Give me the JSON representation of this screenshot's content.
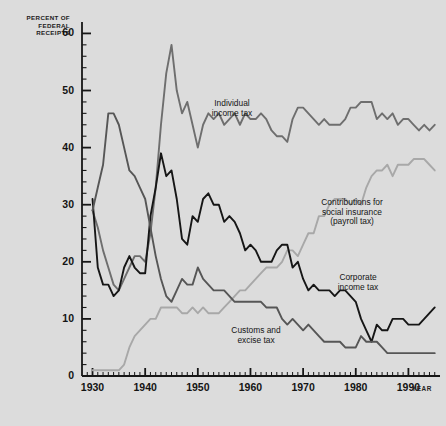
{
  "chart_data": {
    "type": "line",
    "title": "",
    "xlabel": "YEAR",
    "ylabel": "PERCENT OF FEDERAL RECEIPTS",
    "ylabel_lines": [
      "PERCENT OF",
      "FEDERAL",
      "RECEIPTS"
    ],
    "xlim": [
      1928,
      1996
    ],
    "ylim": [
      0,
      62
    ],
    "y_ticks": [
      0,
      10,
      20,
      30,
      40,
      50,
      60
    ],
    "y_tick_labels": [
      "0",
      "10",
      "20",
      "30",
      "40",
      "50",
      "60"
    ],
    "y_minor_tick_step": 2,
    "x_ticks": [
      1930,
      1940,
      1950,
      1960,
      1970,
      1980,
      1990
    ],
    "x_tick_labels": [
      "1930",
      "1940",
      "1950",
      "1960",
      "1970",
      "1980",
      "1990"
    ],
    "x_minor_tick_step": 1,
    "grid": false,
    "legend_position": "inline-annotations",
    "annotations": [
      {
        "id": "individual",
        "lines": [
          "Individual",
          "income tax"
        ],
        "series": "Individual income tax"
      },
      {
        "id": "payroll",
        "lines": [
          "Contributions for",
          "social insurance",
          "(payroll tax)"
        ],
        "series": "Contributions for social insurance (payroll tax)"
      },
      {
        "id": "corporate",
        "lines": [
          "Corporate",
          "income tax"
        ],
        "series": "Corporate income tax"
      },
      {
        "id": "customs",
        "lines": [
          "Customs and",
          "excise tax"
        ],
        "series": "Customs and excise tax"
      }
    ],
    "colors": {
      "individual_income_tax": "#6e6e6e",
      "payroll_tax": "#a8a8a8",
      "corporate_income_tax": "#161616",
      "customs_excise_tax": "#565656",
      "background": "#dcdcdc",
      "axis": "#161616"
    },
    "x": [
      1930,
      1931,
      1932,
      1933,
      1934,
      1935,
      1936,
      1937,
      1938,
      1939,
      1940,
      1941,
      1942,
      1943,
      1944,
      1945,
      1946,
      1947,
      1948,
      1949,
      1950,
      1951,
      1952,
      1953,
      1954,
      1955,
      1956,
      1957,
      1958,
      1959,
      1960,
      1961,
      1962,
      1963,
      1964,
      1965,
      1966,
      1967,
      1968,
      1969,
      1970,
      1971,
      1972,
      1973,
      1974,
      1975,
      1976,
      1977,
      1978,
      1979,
      1980,
      1981,
      1982,
      1983,
      1984,
      1985,
      1986,
      1987,
      1988,
      1989,
      1990,
      1991,
      1992,
      1993,
      1994,
      1995
    ],
    "series": [
      {
        "name": "Individual income tax",
        "color": "#6e6e6e",
        "values": [
          29,
          26,
          22,
          19,
          16,
          15,
          17,
          19,
          21,
          21,
          20,
          25,
          33,
          44,
          53,
          58,
          50,
          46,
          48,
          44,
          40,
          44,
          46,
          45,
          46,
          44,
          45,
          46,
          44,
          46,
          45,
          45,
          46,
          45,
          43,
          42,
          42,
          41,
          45,
          47,
          47,
          46,
          45,
          44,
          45,
          44,
          44,
          44,
          45,
          47,
          47,
          48,
          48,
          48,
          45,
          46,
          45,
          46,
          44,
          45,
          45,
          44,
          43,
          44,
          43,
          44
        ]
      },
      {
        "name": "Contributions for social insurance (payroll tax)",
        "color": "#a8a8a8",
        "values": [
          1,
          1,
          1,
          1,
          1,
          1,
          2,
          5,
          7,
          8,
          9,
          10,
          10,
          12,
          12,
          12,
          12,
          11,
          11,
          12,
          11,
          12,
          11,
          11,
          11,
          12,
          13,
          14,
          15,
          15,
          16,
          17,
          18,
          19,
          19,
          19,
          20,
          22,
          22,
          21,
          23,
          25,
          25,
          28,
          28,
          30,
          31,
          31,
          31,
          30,
          31,
          30,
          33,
          35,
          36,
          36,
          37,
          35,
          37,
          37,
          37,
          38,
          38,
          38,
          37,
          36
        ]
      },
      {
        "name": "Corporate income tax",
        "color": "#161616",
        "values": [
          31,
          19,
          16,
          16,
          14,
          15,
          19,
          21,
          19,
          18,
          18,
          28,
          33,
          39,
          35,
          36,
          31,
          24,
          23,
          28,
          27,
          31,
          32,
          30,
          30,
          27,
          28,
          27,
          25,
          22,
          23,
          22,
          20,
          20,
          20,
          22,
          23,
          23,
          19,
          20,
          17,
          15,
          16,
          15,
          15,
          15,
          14,
          15,
          15,
          14,
          13,
          10,
          8,
          6,
          9,
          8,
          8,
          10,
          10,
          10,
          9,
          9,
          9,
          10,
          11,
          12
        ]
      },
      {
        "name": "Customs and excise tax",
        "color": "#565656",
        "values": [
          29,
          33,
          37,
          46,
          46,
          44,
          40,
          36,
          35,
          33,
          31,
          26,
          21,
          17,
          14,
          13,
          15,
          17,
          16,
          16,
          19,
          17,
          16,
          15,
          15,
          15,
          14,
          13,
          13,
          13,
          13,
          13,
          13,
          12,
          12,
          12,
          10,
          9,
          10,
          9,
          8,
          9,
          8,
          7,
          6,
          6,
          6,
          6,
          5,
          5,
          5,
          7,
          6,
          6,
          6,
          5,
          4,
          4,
          4,
          4,
          4,
          4,
          4,
          4,
          4,
          4
        ]
      }
    ]
  }
}
